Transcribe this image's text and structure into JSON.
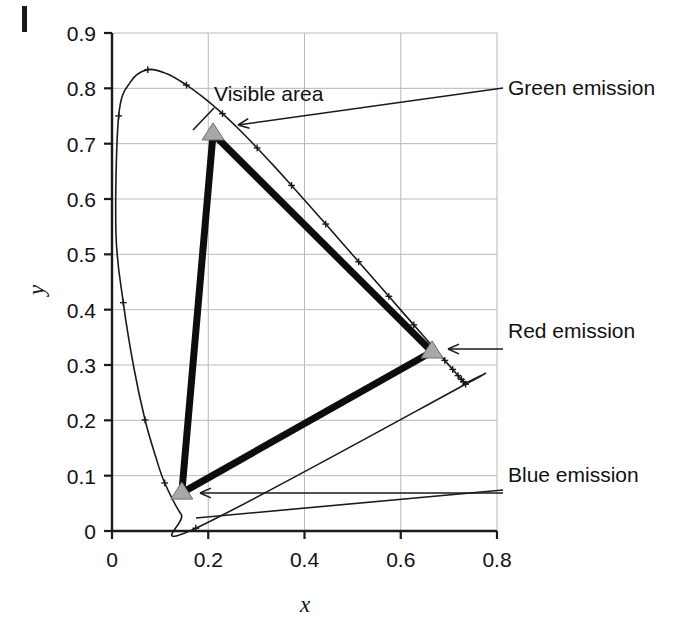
{
  "figure": {
    "corner_mark": "|",
    "background": "#ffffff",
    "ink": "#111111",
    "grid_color": "#b9b9b9",
    "marker_fill": "#a8a8a8",
    "marker_stroke": "#6f6f6f"
  },
  "annotations": [
    {
      "id": "visible-area",
      "label": "Visible area",
      "x": 214,
      "y": 101
    },
    {
      "id": "green-emission",
      "label": "Green emission",
      "x": 508,
      "y": 95
    },
    {
      "id": "red-emission",
      "label": "Red emission",
      "x": 508,
      "y": 338
    },
    {
      "id": "blue-emission",
      "label": "Blue emission",
      "x": 508,
      "y": 482
    }
  ],
  "chart_data": {
    "type": "scatter",
    "title": "",
    "xlabel": "x",
    "ylabel": "y",
    "xlim": [
      0,
      0.8
    ],
    "ylim": [
      0,
      0.9
    ],
    "xticks": [
      0,
      0.2,
      0.4,
      0.6,
      0.8
    ],
    "xticklabels": [
      "0",
      "0.2",
      "0.4",
      "0.6",
      "0.8"
    ],
    "yticks": [
      0,
      0.1,
      0.2,
      0.3,
      0.4,
      0.5,
      0.6,
      0.7,
      0.8,
      0.9
    ],
    "yticklabels": [
      "0",
      "0.1",
      "0.2",
      "0.3",
      "0.4",
      "0.5",
      "0.6",
      "0.7",
      "0.8",
      "0.9"
    ],
    "grid": true,
    "legend": "none",
    "series": [
      {
        "name": "Visible area (spectral locus)",
        "type": "line",
        "closed": true,
        "marker": "plus",
        "points": [
          [
            0.1741,
            0.005
          ],
          [
            0.144,
            0.0297
          ],
          [
            0.1096,
            0.0868
          ],
          [
            0.0913,
            0.1327
          ],
          [
            0.0687,
            0.2007
          ],
          [
            0.0454,
            0.295
          ],
          [
            0.0235,
            0.4127
          ],
          [
            0.0082,
            0.5384
          ],
          [
            0.0139,
            0.7502
          ],
          [
            0.0389,
            0.812
          ],
          [
            0.0743,
            0.8338
          ],
          [
            0.1142,
            0.8262
          ],
          [
            0.1547,
            0.8059
          ],
          [
            0.1929,
            0.7816
          ],
          [
            0.2296,
            0.7543
          ],
          [
            0.2658,
            0.7243
          ],
          [
            0.3016,
            0.6923
          ],
          [
            0.3373,
            0.6589
          ],
          [
            0.3731,
            0.6245
          ],
          [
            0.4087,
            0.5896
          ],
          [
            0.4441,
            0.5547
          ],
          [
            0.4788,
            0.5202
          ],
          [
            0.5125,
            0.4866
          ],
          [
            0.5448,
            0.4544
          ],
          [
            0.5752,
            0.4242
          ],
          [
            0.6029,
            0.3965
          ],
          [
            0.627,
            0.3725
          ],
          [
            0.6482,
            0.3514
          ],
          [
            0.6658,
            0.334
          ],
          [
            0.6801,
            0.3197
          ],
          [
            0.6915,
            0.3083
          ],
          [
            0.7006,
            0.2993
          ],
          [
            0.7079,
            0.292
          ],
          [
            0.714,
            0.2859
          ],
          [
            0.719,
            0.2809
          ],
          [
            0.723,
            0.277
          ],
          [
            0.726,
            0.274
          ],
          [
            0.7283,
            0.2717
          ],
          [
            0.73,
            0.27
          ],
          [
            0.7334,
            0.2666
          ],
          [
            0.7347,
            0.2653
          ]
        ]
      },
      {
        "name": "Emission gamut triangle",
        "type": "line",
        "closed": true,
        "linewidth": 7,
        "points": [
          [
            0.21,
            0.718
          ],
          [
            0.665,
            0.324
          ],
          [
            0.145,
            0.069
          ]
        ]
      }
    ],
    "markers": [
      {
        "name": "Green emission",
        "x": 0.21,
        "y": 0.718,
        "shape": "triangle",
        "fill": "#a8a8a8"
      },
      {
        "name": "Red emission",
        "x": 0.665,
        "y": 0.324,
        "shape": "triangle",
        "fill": "#a8a8a8"
      },
      {
        "name": "Blue emission",
        "x": 0.145,
        "y": 0.069,
        "shape": "triangle",
        "fill": "#a8a8a8"
      }
    ],
    "leader_lines": [
      {
        "name": "green-leader",
        "from": [
          503,
          88
        ],
        "to": [
          238,
          125
        ],
        "arrow": true
      },
      {
        "name": "visible-leader",
        "from": [
          214,
          108
        ],
        "to": [
          193,
          130
        ],
        "arrow": false
      },
      {
        "name": "red-leader",
        "from": [
          503,
          349
        ],
        "to": [
          448,
          349
        ],
        "arrow": true
      },
      {
        "name": "blue-leader-a",
        "from": [
          503,
          493
        ],
        "to": [
          200,
          493
        ],
        "arrow": true
      },
      {
        "name": "blue-leader-b",
        "from": [
          503,
          490
        ],
        "to": [
          196,
          518
        ],
        "arrow": false
      }
    ]
  }
}
